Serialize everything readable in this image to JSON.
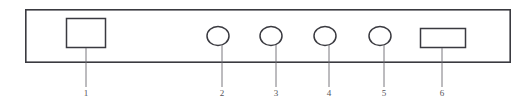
{
  "diagram": {
    "type": "technical-line-drawing",
    "canvas": {
      "width": 531,
      "height": 109
    },
    "colors": {
      "background": "#ffffff",
      "outline": "#3a3a40",
      "leader_line": "#6b6a70",
      "label_text": "#55545a"
    },
    "panel": {
      "name": "panel-outline",
      "shape": "rectangle",
      "x": 25,
      "y": 9,
      "width": 486,
      "height": 54,
      "stroke_width": 1.6
    },
    "components": [
      {
        "id": 1,
        "label": "1",
        "name": "display-window",
        "shape": "rectangle",
        "x": 66,
        "y": 18,
        "width": 40,
        "height": 30,
        "leader_x": 86,
        "leader_y_start": 48,
        "leader_y_end": 88,
        "label_x": 86,
        "label_y": 88
      },
      {
        "id": 2,
        "label": "2",
        "name": "control-knob-1",
        "shape": "ellipse",
        "cx": 218,
        "cy": 36,
        "rx": 11,
        "ry": 9.5,
        "leader_x": 222,
        "leader_y_start": 45,
        "leader_y_end": 88,
        "label_x": 222,
        "label_y": 88
      },
      {
        "id": 3,
        "label": "3",
        "name": "control-knob-2",
        "shape": "ellipse",
        "cx": 271,
        "cy": 36,
        "rx": 11,
        "ry": 9.5,
        "leader_x": 276,
        "leader_y_start": 45,
        "leader_y_end": 88,
        "label_x": 276,
        "label_y": 88
      },
      {
        "id": 4,
        "label": "4",
        "name": "control-knob-3",
        "shape": "ellipse",
        "cx": 325,
        "cy": 36,
        "rx": 11,
        "ry": 9.5,
        "leader_x": 329,
        "leader_y_start": 45,
        "leader_y_end": 88,
        "label_x": 329,
        "label_y": 88
      },
      {
        "id": 5,
        "label": "5",
        "name": "control-knob-4",
        "shape": "ellipse",
        "cx": 380,
        "cy": 36,
        "rx": 11,
        "ry": 9.5,
        "leader_x": 384,
        "leader_y_start": 45,
        "leader_y_end": 88,
        "label_x": 384,
        "label_y": 88
      },
      {
        "id": 6,
        "label": "6",
        "name": "indicator-panel",
        "shape": "rectangle",
        "x": 420,
        "y": 28,
        "width": 46,
        "height": 20,
        "leader_x": 442,
        "leader_y_start": 48,
        "leader_y_end": 88,
        "label_x": 442,
        "label_y": 88
      }
    ]
  }
}
